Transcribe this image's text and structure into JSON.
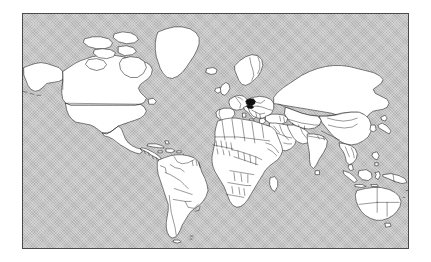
{
  "figure": {
    "type": "world-map",
    "projection": "equirectangular",
    "title": "",
    "caption": ""
  },
  "map": {
    "frame": {
      "x": 22,
      "y": 13,
      "width": 387,
      "height": 236,
      "border_color": "#4a4a4a"
    },
    "page_background": "#ffffff",
    "ocean_color": "#b4b4b4",
    "ocean_fill_style": "dithered-halftone-gray",
    "land_fill": "#ffffff",
    "border_stroke": "#1a1a1a",
    "highlight_fill": "#101010",
    "lon_range": [
      -180,
      180
    ],
    "lat_range": [
      -58,
      84
    ],
    "graticule_visible": false,
    "labels_visible": false
  },
  "highlighted": {
    "region_name": "Central Europe",
    "approx_lon": 14.5,
    "approx_lat": 50.0,
    "color": "#101010",
    "count": 1
  },
  "continents": [
    {
      "name": "North America"
    },
    {
      "name": "South America"
    },
    {
      "name": "Europe"
    },
    {
      "name": "Africa"
    },
    {
      "name": "Asia"
    },
    {
      "name": "Oceania"
    }
  ],
  "chart_data": {
    "type": "map",
    "title": "",
    "xlabel": "",
    "ylabel": "",
    "xlim": [
      -180,
      180
    ],
    "ylim": [
      -58,
      84
    ],
    "grid": false,
    "legend": null,
    "series": [
      {
        "name": "Countries (unhighlighted)",
        "fill": "#ffffff",
        "stroke": "#1a1a1a",
        "value": 0
      },
      {
        "name": "Highlighted country",
        "fill": "#101010",
        "stroke": "#101010",
        "value": 1,
        "location": {
          "lon": 14.5,
          "lat": 50.0
        }
      },
      {
        "name": "Ocean / background",
        "fill": "#b4b4b4",
        "value": null
      }
    ],
    "annotations": []
  }
}
